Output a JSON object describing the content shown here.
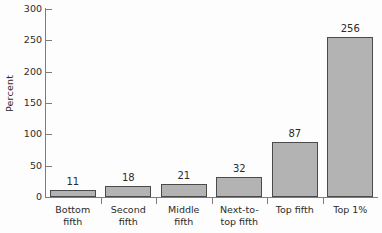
{
  "chart_data": {
    "type": "bar",
    "title": "",
    "subtitle": "",
    "xlabel": "",
    "ylabel": "Percent",
    "ylim": [
      0,
      300
    ],
    "ytick_labels": [
      "0",
      "50",
      "100",
      "150",
      "200",
      "250",
      "300"
    ],
    "ytick_values": [
      0,
      50,
      100,
      150,
      200,
      250,
      300
    ],
    "grid": false,
    "legend": false,
    "legend_position": "none",
    "categories": [
      "Bottom\nfifth",
      "Second\nfifth",
      "Middle\nfifth",
      "Next-to-\ntop fifth",
      "Top fifth",
      "Top 1%"
    ],
    "values": [
      11,
      18,
      21,
      32,
      87,
      256
    ],
    "value_labels": [
      "11",
      "18",
      "21",
      "32",
      "87",
      "256"
    ],
    "bar_fill_color": "#b3b3b3",
    "bar_edge_color": "#4a4a4a",
    "axis_color": "#7d7d7d",
    "text_color": "#2b2b2b",
    "background_color": "#fdfdfd"
  }
}
